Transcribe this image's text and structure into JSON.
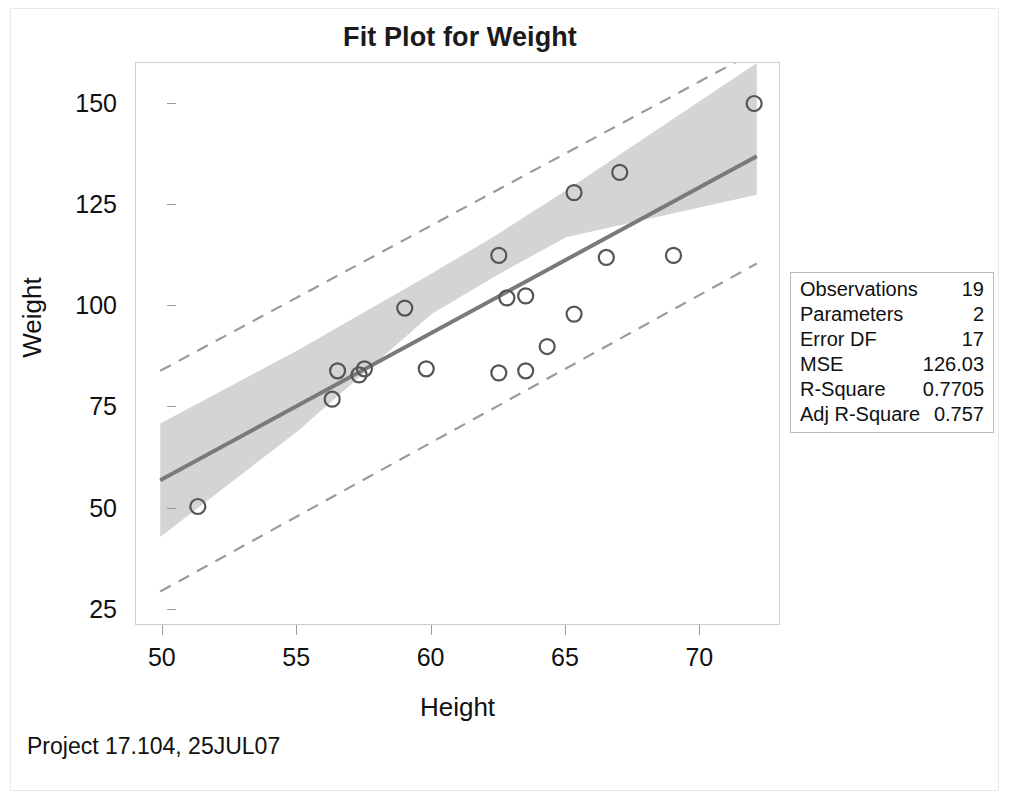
{
  "chart_data": {
    "type": "scatter",
    "title": "Fit Plot for Weight",
    "xlabel": "Height",
    "ylabel": "Weight",
    "xlim": [
      49.0,
      73.0
    ],
    "ylim": [
      21.0,
      160.0
    ],
    "xticks": [
      50,
      55,
      60,
      65,
      70
    ],
    "yticks": [
      25,
      50,
      75,
      100,
      125,
      150
    ],
    "grid": false,
    "legend": "none",
    "x": [
      51.3,
      56.3,
      56.5,
      57.3,
      57.5,
      59.0,
      59.8,
      62.5,
      62.5,
      62.8,
      63.5,
      63.5,
      64.3,
      65.3,
      65.3,
      66.5,
      67.0,
      69.0,
      72.0
    ],
    "y": [
      50.5,
      77.0,
      84.0,
      83.0,
      84.5,
      99.5,
      84.5,
      83.5,
      112.5,
      102.0,
      84.0,
      102.5,
      90.0,
      98.0,
      128.0,
      112.0,
      133.0,
      112.5,
      150.0
    ],
    "marker": "open-circle",
    "fit_line": {
      "name": "Fit",
      "x": [
        49.9,
        72.1
      ],
      "y": [
        57.0,
        137.0
      ],
      "style": "solid",
      "color": "#7a7a7a"
    },
    "confidence_band": {
      "name": "95% Confidence Limits",
      "color": "#d4d4d4",
      "x": [
        49.9,
        55.0,
        60.0,
        62.4,
        65.0,
        72.1
      ],
      "upper": [
        71.0,
        89.0,
        108.0,
        117.5,
        128.5,
        160.0
      ],
      "lower": [
        43.0,
        69.0,
        98.0,
        107.5,
        117.0,
        127.5
      ]
    },
    "prediction_upper": {
      "name": "95% Prediction Limits",
      "style": "dashed",
      "color": "#9b9b9b",
      "x": [
        49.9,
        72.1
      ],
      "y": [
        84.0,
        163.0
      ]
    },
    "prediction_lower": {
      "name": "95% Prediction Limits",
      "style": "dashed",
      "color": "#9b9b9b",
      "x": [
        49.9,
        72.1
      ],
      "y": [
        29.5,
        110.5
      ]
    }
  },
  "stats": {
    "rows": [
      {
        "label": "Observations",
        "value": "19"
      },
      {
        "label": "Parameters",
        "value": "2"
      },
      {
        "label": "Error DF",
        "value": "17"
      },
      {
        "label": "MSE",
        "value": "126.03"
      },
      {
        "label": "R-Square",
        "value": "0.7705"
      },
      {
        "label": "Adj R-Square",
        "value": "0.757"
      }
    ]
  },
  "footer": {
    "note": "Project 17.104, 25JUL07"
  },
  "colors": {
    "text": "#111111",
    "band": "#d4d4d4",
    "fit_line": "#7a7a7a",
    "limits": "#9b9b9b",
    "marker_stroke": "#555555",
    "axis": "#cfcfcf"
  }
}
